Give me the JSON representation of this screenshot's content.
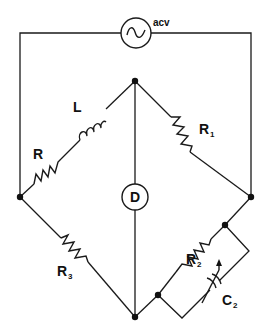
{
  "diagram": {
    "type": "AC bridge circuit (Maxwell-type inductance bridge)",
    "source": {
      "label": "acv",
      "symbol": "sine-wave-source"
    },
    "detector": {
      "label": "D"
    },
    "components": [
      {
        "id": "R",
        "label": "R",
        "sub": "",
        "kind": "resistor",
        "arm": "top-left"
      },
      {
        "id": "L",
        "label": "L",
        "sub": "",
        "kind": "inductor",
        "arm": "top-left"
      },
      {
        "id": "R1",
        "label": "R",
        "sub": "1",
        "kind": "resistor",
        "arm": "top-right"
      },
      {
        "id": "R3",
        "label": "R",
        "sub": "3",
        "kind": "resistor",
        "arm": "bottom-left"
      },
      {
        "id": "R2",
        "label": "R",
        "sub": "2",
        "kind": "resistor",
        "arm": "bottom-right"
      },
      {
        "id": "C2",
        "label": "C",
        "sub": "2",
        "kind": "variable-capacitor",
        "arm": "bottom-right (parallel with R2)"
      }
    ],
    "nodes": [
      "top",
      "left",
      "right",
      "bottom",
      "R2-upper",
      "R2-lower"
    ]
  }
}
